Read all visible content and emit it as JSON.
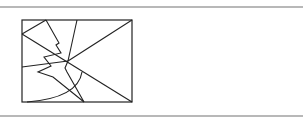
{
  "figure": {
    "stroke_color": "#222222",
    "rule_color": "#b8b8b8",
    "rectangle": {
      "x": 22,
      "y": 20,
      "width": 110,
      "height": 82
    },
    "lines": [
      {
        "name": "left-to-top",
        "x1": 22,
        "y1": 34,
        "x2": 46,
        "y2": 20
      },
      {
        "name": "left-to-bottom-right",
        "x1": 22,
        "y1": 34,
        "x2": 132,
        "y2": 102
      },
      {
        "name": "top-to-center",
        "x1": 77,
        "y1": 20,
        "x2": 68,
        "y2": 61
      },
      {
        "name": "center-to-top-right",
        "x1": 68,
        "y1": 61,
        "x2": 132,
        "y2": 20
      },
      {
        "name": "left-to-center",
        "x1": 22,
        "y1": 67,
        "x2": 68,
        "y2": 61
      }
    ],
    "zigzags": [
      {
        "name": "zigzag-left",
        "points": "46,20 59,43 56,45 61,53 44,57 51,66 38,72 53,77 84,102"
      },
      {
        "name": "zigzag-center",
        "points": "68,61 65,68 67,72 84,102"
      }
    ],
    "arc": {
      "name": "quarter-arc",
      "d": "M 27 102 Q 78 98 82 72"
    }
  }
}
